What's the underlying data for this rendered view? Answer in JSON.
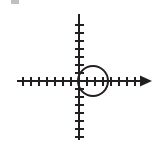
{
  "figure": {
    "name": "coordinate-plane-with-circle",
    "background_color": "#ffffff",
    "stroke_color": "#231f20",
    "canvas": {
      "width": 162,
      "height": 145
    }
  },
  "chart_data": {
    "type": "scatter",
    "title": "",
    "subtitle": "",
    "xlabel": "",
    "ylabel": "",
    "grid": false,
    "legend_position": "none",
    "axes": {
      "origin_px": {
        "x": 79,
        "y": 81
      },
      "unit_px": 8,
      "x_axis": {
        "name": "x-axis",
        "start_px": 17,
        "end_px": 152,
        "y_px": 81,
        "arrow_start": false,
        "arrow_end": true,
        "tick_length_px": 9,
        "tick_values": [
          -7,
          -6,
          -5,
          -4,
          -3,
          -2,
          -1,
          1,
          2,
          3,
          4,
          5,
          6,
          7
        ],
        "tick_labels": []
      },
      "y_axis": {
        "name": "y-axis",
        "start_px": 14,
        "end_px": 140,
        "x_px": 79,
        "arrow_start": false,
        "arrow_end": false,
        "tick_length_px": 9,
        "tick_values": [
          -7,
          -6,
          -5,
          -4,
          -3,
          -2,
          -1,
          1,
          2,
          3,
          4,
          5,
          6,
          7
        ],
        "tick_labels": []
      }
    },
    "shapes": [
      {
        "name": "circle-at-origin",
        "type": "circle",
        "center": {
          "x": 1.8,
          "y": 0
        },
        "center_px": {
          "x": 93,
          "y": 81
        },
        "radius": 1.8,
        "radius_px": 15,
        "stroke": "#231f20",
        "stroke_width_px": 2,
        "fill": "none"
      }
    ]
  },
  "annotations": {
    "top_left_artifact": {
      "name": "scan-artifact-mark",
      "visible": true,
      "color": "#8a8a8a"
    }
  }
}
